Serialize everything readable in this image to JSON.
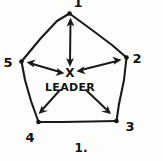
{
  "figure": {
    "caption": "1.",
    "center_mark": "X",
    "center_label": "LEADER",
    "ink_color": "#1a1a1a",
    "background_color": "#fdfdfc",
    "shape": "pentagon",
    "vertex_count": 5
  },
  "vertices": [
    {
      "id": "v1",
      "label": "1",
      "position": "top",
      "label_x": 78,
      "label_y": 6,
      "node_x": 69,
      "node_y": 14,
      "clipped": true
    },
    {
      "id": "v2",
      "label": "2",
      "position": "upper-right",
      "label_x": 137,
      "label_y": 60,
      "node_x": 126,
      "node_y": 58,
      "clipped": false
    },
    {
      "id": "v3",
      "label": "3",
      "position": "lower-right",
      "label_x": 128,
      "label_y": 129,
      "node_x": 116,
      "node_y": 121,
      "clipped": false
    },
    {
      "id": "v4",
      "label": "4",
      "position": "lower-left",
      "label_x": 29,
      "label_y": 140,
      "node_x": 38,
      "node_y": 122,
      "clipped": false
    },
    {
      "id": "v5",
      "label": "5",
      "position": "upper-left",
      "label_x": 7,
      "label_y": 64,
      "node_x": 21,
      "node_y": 62,
      "clipped": false
    }
  ],
  "connections": [
    {
      "from": "center",
      "to": "v1",
      "arrow": "double"
    },
    {
      "from": "center",
      "to": "v2",
      "arrow": "double"
    },
    {
      "from": "center",
      "to": "v3",
      "arrow": "single"
    },
    {
      "from": "center",
      "to": "v4",
      "arrow": "single"
    },
    {
      "from": "center",
      "to": "v5",
      "arrow": "double"
    }
  ],
  "center": {
    "x": 70,
    "y": 72
  }
}
